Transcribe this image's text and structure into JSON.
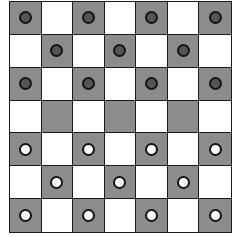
{
  "board": {
    "rows": 7,
    "cols": 7,
    "colors": {
      "dark_square": "#8c8c8c",
      "light_square": "#ffffff",
      "grid_line": "#1a1a1a",
      "dark_piece": "#555555",
      "light_piece": "#ffffff"
    },
    "top_left_square": "dark",
    "pieces": [
      [
        "B",
        "",
        "B",
        "",
        "B",
        "",
        "B"
      ],
      [
        "",
        "B",
        "",
        "B",
        "",
        "B",
        ""
      ],
      [
        "B",
        "",
        "B",
        "",
        "B",
        "",
        "B"
      ],
      [
        "",
        "",
        "",
        "",
        "",
        "",
        ""
      ],
      [
        "W",
        "",
        "W",
        "",
        "W",
        "",
        "W"
      ],
      [
        "",
        "W",
        "",
        "W",
        "",
        "W",
        ""
      ],
      [
        "W",
        "",
        "W",
        "",
        "W",
        "",
        "W"
      ]
    ]
  }
}
